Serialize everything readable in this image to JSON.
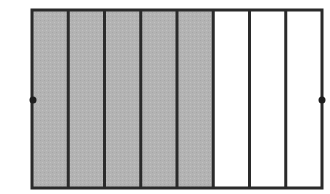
{
  "diagram": {
    "total_parts": 8,
    "shaded_parts": 5,
    "fraction_shaded": "5/8",
    "colors": {
      "background": "#ffffff",
      "shaded_fill": "#b3b3b3",
      "unshaded_fill": "#ffffff",
      "stroke": "#2a2a2a",
      "dot": "#1e1e1e"
    },
    "rect": {
      "x": 32,
      "y": 10,
      "width": 290,
      "height": 178
    },
    "stroke_width": 3,
    "dots": [
      {
        "name": "left-midpoint",
        "cx": 33,
        "cy": 100,
        "r": 3.5
      },
      {
        "name": "right-midpoint",
        "cx": 322,
        "cy": 100,
        "r": 3.5
      }
    ]
  }
}
